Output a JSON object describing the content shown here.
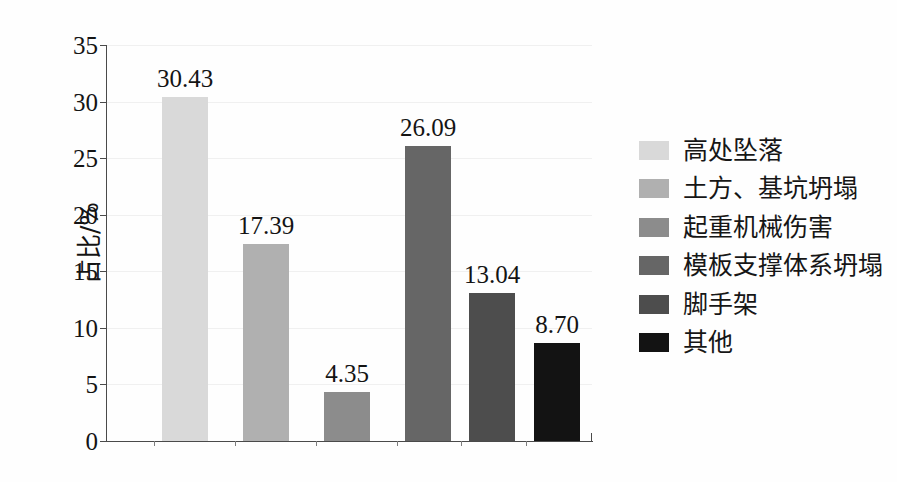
{
  "chart_data": {
    "type": "bar",
    "title": "",
    "subtitle": "",
    "xlabel": "",
    "ylabel": "占比/%",
    "ylim": [
      0,
      35
    ],
    "yticks": [
      "0",
      "5",
      "10",
      "15",
      "20",
      "25",
      "30",
      "35"
    ],
    "ytick_values": [
      0,
      5,
      10,
      15,
      20,
      25,
      30,
      35
    ],
    "grid": true,
    "grid_axis": "y",
    "legend_position": "right",
    "categories": [
      "高处坠落",
      "土方、基坑坍塌",
      "起重机械伤害",
      "模板支撑体系坍塌",
      "脚手架",
      "其他"
    ],
    "values": [
      30.43,
      17.39,
      4.35,
      26.09,
      13.04,
      8.7
    ],
    "data_labels": [
      "30.43",
      "17.39",
      "4.35",
      "26.09",
      "13.04",
      "8.70"
    ],
    "colors": [
      "#d9d9d9",
      "#b0b0b0",
      "#8c8c8c",
      "#666666",
      "#4d4d4d",
      "#131313"
    ],
    "bars": [
      {
        "label": "高处坠落",
        "value": 30.43,
        "data_label": "30.43",
        "color": "#d9d9d9",
        "left_px": 55,
        "width_px": 46
      },
      {
        "label": "土方、基坑坍塌",
        "value": 17.39,
        "data_label": "17.39",
        "color": "#b0b0b0",
        "left_px": 136,
        "width_px": 46
      },
      {
        "label": "起重机械伤害",
        "value": 4.35,
        "data_label": "4.35",
        "color": "#8c8c8c",
        "left_px": 217,
        "width_px": 46
      },
      {
        "label": "模板支撑体系坍塌",
        "value": 26.09,
        "data_label": "26.09",
        "color": "#666666",
        "left_px": 298,
        "width_px": 46
      },
      {
        "label": "脚手架",
        "value": 13.04,
        "data_label": "13.04",
        "color": "#4d4d4d",
        "left_px": 362,
        "width_px": 46
      },
      {
        "label": "其他",
        "value": 8.7,
        "data_label": "8.70",
        "color": "#131313",
        "left_px": 427,
        "width_px": 46
      }
    ]
  },
  "legend": {
    "items": [
      {
        "label": "高处坠落",
        "color": "#d9d9d9"
      },
      {
        "label": "土方、基坑坍塌",
        "color": "#b0b0b0"
      },
      {
        "label": "起重机械伤害",
        "color": "#8c8c8c"
      },
      {
        "label": "模板支撑体系坍塌",
        "color": "#666666"
      },
      {
        "label": "脚手架",
        "color": "#4d4d4d"
      },
      {
        "label": "其他",
        "color": "#131313"
      }
    ]
  },
  "axis": {
    "y_title": "占比/%"
  }
}
